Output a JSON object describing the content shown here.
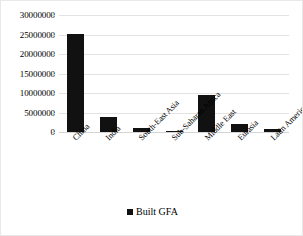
{
  "chart_data": {
    "type": "bar",
    "title": "",
    "subtitle": "",
    "xlabel": "",
    "ylabel": "",
    "categories": [
      "China",
      "India",
      "South-East Asia",
      "Sub-Saharan Africa",
      "Middle East",
      "Eurasia",
      "Latin America"
    ],
    "series": [
      {
        "name": "Built GFA",
        "color": "#111111",
        "values": [
          25100000,
          3800000,
          1100000,
          150000,
          9500000,
          2100000,
          700000
        ]
      }
    ],
    "values": [
      25100000,
      3800000,
      1100000,
      150000,
      9500000,
      2100000,
      700000
    ],
    "ylim": [
      0,
      30000000
    ],
    "ytick_labels": [
      "0",
      "5000000",
      "10000000",
      "15000000",
      "20000000",
      "25000000",
      "30000000"
    ],
    "ytick_values": [
      0,
      5000000,
      10000000,
      15000000,
      20000000,
      25000000,
      30000000
    ],
    "grid": true,
    "grid_axis": "y",
    "legend": {
      "position": "bottom",
      "entries": [
        {
          "label": "Built GFA",
          "color": "#111111",
          "marker": "square-marker"
        }
      ]
    },
    "xlabel_rotation": -45,
    "bar_color": "#111111",
    "gridline_color": "#e3e3e3",
    "border_color": "#e8e8e8",
    "background": "#ffffff"
  }
}
